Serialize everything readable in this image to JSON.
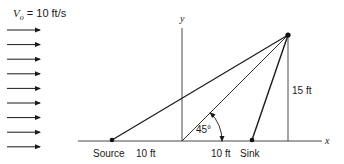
{
  "title_label": {
    "symbol": "V",
    "subscript": "o",
    "rest": " = 10 ft/s"
  },
  "flow_arrows": {
    "count": 9,
    "x1": 7,
    "x2": 40,
    "y_start": 30,
    "y_step": 14.6
  },
  "axes": {
    "x_label": "x",
    "y_label": "y",
    "origin": [
      182,
      141
    ],
    "x_start": 78,
    "x_end": 322,
    "y_top": 28
  },
  "points": {
    "source": {
      "label": "Source",
      "pos": [
        112,
        140
      ]
    },
    "sink": {
      "label": "Sink",
      "pos": [
        252,
        140
      ]
    },
    "p": {
      "pos": [
        288,
        35
      ]
    }
  },
  "dimensions": {
    "source_to_origin": "10 ft",
    "origin_to_sink": "10 ft",
    "height": "15 ft"
  },
  "angle": {
    "label": "45°",
    "radius": 40
  },
  "colors": {
    "line": "#1a1a1a",
    "axis": "#333333"
  }
}
